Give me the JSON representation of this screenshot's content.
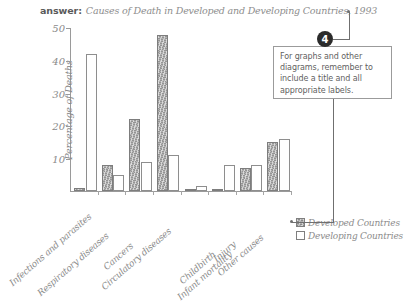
{
  "header": {
    "answer_label": "answer:",
    "title": "Causes of Death in Developed and Developing Countries, 1993"
  },
  "callout": {
    "badge": "4",
    "text": "For graphs and other diagrams, remember to include a title and all appropriate labels."
  },
  "legend": {
    "items": [
      {
        "label": "Developed Countries",
        "swatch": "shaded-gray",
        "color": "#b0b0b0"
      },
      {
        "label": "Developing Countries",
        "swatch": "white-outline",
        "color": "#ffffff"
      }
    ]
  },
  "chart_data": {
    "type": "bar",
    "title": "Causes of Death in Developed and Developing Countries, 1993",
    "xlabel": "",
    "ylabel": "Percentage of Deaths",
    "ylim": [
      0,
      50
    ],
    "yticks": [
      10,
      20,
      30,
      40,
      50
    ],
    "grid": false,
    "legend_position": "bottom-right",
    "categories": [
      "Infections and parasites",
      "Respiratory diseases",
      "Cancers",
      "Circulatory diseases",
      "Childbirth",
      "Infant mortality",
      "Injury",
      "Other causes"
    ],
    "series": [
      {
        "name": "Developed Countries",
        "color": "#b0b0b0",
        "values": [
          1,
          8,
          22,
          48,
          0.3,
          0.5,
          7,
          15
        ]
      },
      {
        "name": "Developing Countries",
        "color": "#ffffff",
        "values": [
          42,
          5,
          9,
          11,
          1.5,
          8,
          8,
          16
        ]
      }
    ]
  }
}
